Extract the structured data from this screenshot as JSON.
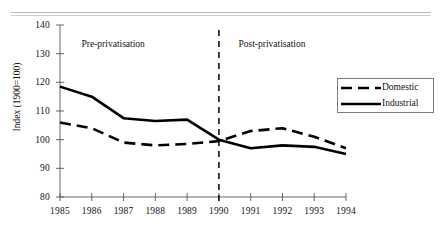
{
  "chart_data": {
    "type": "line",
    "title": "",
    "xlabel": "",
    "ylabel": "Index (1900=100)",
    "x": [
      1985,
      1986,
      1987,
      1988,
      1989,
      1990,
      1991,
      1992,
      1993,
      1994
    ],
    "categories": [
      "1985",
      "1986",
      "1987",
      "1988",
      "1989",
      "1990",
      "1991",
      "1992",
      "1993",
      "1994"
    ],
    "xlim": [
      1985,
      1994
    ],
    "ylim": [
      80,
      140
    ],
    "yticks": [
      80,
      90,
      100,
      110,
      120,
      130,
      140
    ],
    "ytick_labels": [
      "80",
      "90",
      "100",
      "110",
      "120",
      "130",
      "140"
    ],
    "grid": false,
    "legend_position": "right",
    "series": [
      {
        "name": "Domestic",
        "style": "dashed",
        "color": "#000000",
        "values": [
          106,
          104,
          99,
          98,
          98.5,
          99.5,
          103,
          104,
          101,
          97
        ]
      },
      {
        "name": "Industrial",
        "style": "solid",
        "color": "#000000",
        "values": [
          118.5,
          115,
          107.5,
          106.5,
          107,
          100,
          97,
          98,
          97.5,
          95
        ]
      }
    ],
    "annotations": [
      {
        "text": "Pre-privatisation",
        "x": 1987,
        "y": 133
      },
      {
        "text": "Post-privatisation",
        "x": 1992,
        "y": 133
      }
    ],
    "reference_lines": [
      {
        "axis": "x",
        "value": 1990,
        "style": "dashed",
        "color": "#111111"
      }
    ]
  },
  "legend": {
    "items": [
      {
        "label": "Domestic",
        "style": "dashed"
      },
      {
        "label": "Industrial",
        "style": "solid"
      }
    ]
  }
}
